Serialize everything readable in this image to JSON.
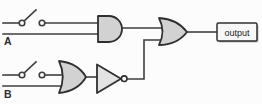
{
  "diagram": {
    "kind": "logic-circuit",
    "labels": {
      "input_a": "A",
      "input_b": "B",
      "output": "output"
    },
    "components": {
      "switch_a": "open-switch",
      "switch_b": "open-switch",
      "and_gate": "AND",
      "or_gate_top": "OR",
      "or_gate_bottom": "OR",
      "not_gate": "NOT"
    },
    "connections": [
      "switch A and line A feed AND gate inputs",
      "switch B and line B feed lower OR gate inputs",
      "lower OR gate output feeds NOT gate",
      "AND gate output and NOT gate output feed top OR gate",
      "top OR gate output feeds output box"
    ],
    "colors": {
      "gate_fill": "#d2d2d2",
      "not_gate_fill": "#e3e3e3",
      "wire": "#3f3f3f",
      "background": "#fcfcfc"
    }
  }
}
